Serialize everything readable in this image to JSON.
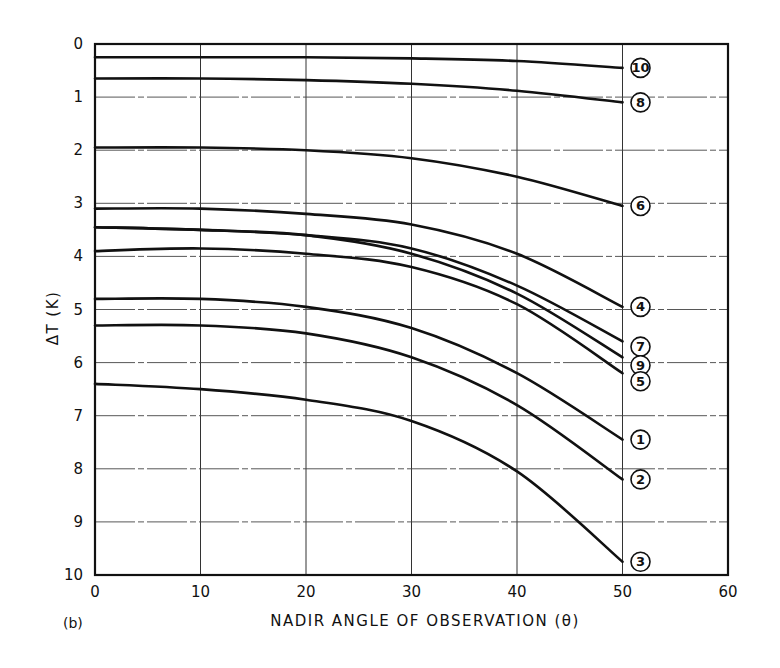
{
  "chart_data": {
    "type": "line",
    "title": "",
    "panel_label": "(b)",
    "xlabel": "NADIR ANGLE OF OBSERVATION (θ)",
    "ylabel": "ΔT  (K)",
    "xlim": [
      0,
      60
    ],
    "ylim": [
      0,
      10
    ],
    "y_inverted": true,
    "grid": true,
    "legend_position": "inline labels at right end of each curve (circled numbers)",
    "x_ticks": [
      "0",
      "10",
      "20",
      "30",
      "40",
      "50",
      "60"
    ],
    "y_ticks": [
      "0",
      "1",
      "2",
      "3",
      "4",
      "5",
      "6",
      "7",
      "8",
      "9",
      "10"
    ],
    "x": [
      0,
      10,
      20,
      30,
      40,
      50
    ],
    "series": [
      {
        "name": "10",
        "values": [
          0.25,
          0.25,
          0.25,
          0.27,
          0.32,
          0.45
        ]
      },
      {
        "name": "8",
        "values": [
          0.65,
          0.65,
          0.68,
          0.75,
          0.88,
          1.1
        ]
      },
      {
        "name": "6",
        "values": [
          1.95,
          1.95,
          2.0,
          2.15,
          2.5,
          3.05
        ]
      },
      {
        "name": "4",
        "values": [
          3.1,
          3.1,
          3.2,
          3.4,
          3.95,
          4.95
        ]
      },
      {
        "name": "7",
        "values": [
          3.45,
          3.5,
          3.6,
          3.85,
          4.55,
          5.6
        ]
      },
      {
        "name": "9",
        "values": [
          3.45,
          3.5,
          3.6,
          3.95,
          4.7,
          5.9
        ]
      },
      {
        "name": "5",
        "values": [
          3.9,
          3.85,
          3.95,
          4.2,
          4.9,
          6.2
        ]
      },
      {
        "name": "1",
        "values": [
          4.8,
          4.8,
          4.95,
          5.35,
          6.2,
          7.45
        ]
      },
      {
        "name": "2",
        "values": [
          5.3,
          5.3,
          5.45,
          5.9,
          6.8,
          8.2
        ]
      },
      {
        "name": "3",
        "values": [
          6.4,
          6.5,
          6.7,
          7.1,
          8.05,
          9.75
        ]
      }
    ],
    "label_offsets": {
      "10": 0,
      "8": 0,
      "6": 0,
      "4": 0,
      "7": 0.1,
      "9": 0.15,
      "5": 0.15,
      "1": 0,
      "2": 0,
      "3": 0
    }
  },
  "colors": {
    "ink": "#111111",
    "grid": "#333333",
    "background": "#ffffff"
  }
}
